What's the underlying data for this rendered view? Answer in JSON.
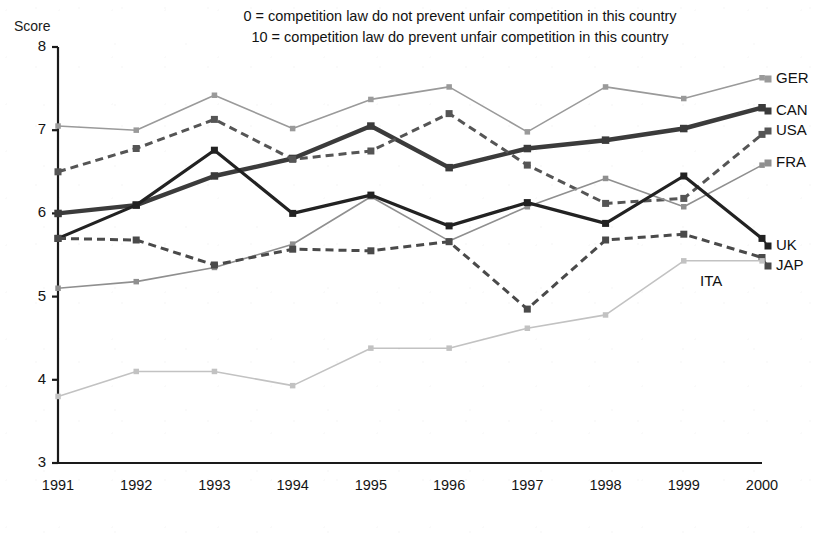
{
  "chart_data": {
    "type": "line",
    "title": "",
    "subtitle_lines": [
      "0 = competition law do not prevent unfair competition in this country",
      "10 = competition law do prevent unfair competition in this country"
    ],
    "ylabel": "Score",
    "xlabel": "",
    "ylim": [
      3,
      8
    ],
    "yticks": [
      "8",
      "7",
      "6",
      "5",
      "4",
      "3"
    ],
    "grid": false,
    "legend_position": "right-end-of-line",
    "categories": [
      "1991",
      "1992",
      "1993",
      "1994",
      "1995",
      "1996",
      "1997",
      "1998",
      "1999",
      "2000"
    ],
    "series": [
      {
        "name": "GER",
        "label": "GER",
        "color": "#9a9a9a",
        "style": "solid-thin",
        "values": [
          7.05,
          7.0,
          7.42,
          7.02,
          7.37,
          7.52,
          6.98,
          7.52,
          7.38,
          7.63
        ]
      },
      {
        "name": "CAN",
        "label": "CAN",
        "color": "#3b3b3b",
        "style": "solid-thick",
        "values": [
          6.0,
          6.1,
          6.45,
          6.66,
          7.05,
          6.55,
          6.78,
          6.88,
          7.02,
          7.27
        ]
      },
      {
        "name": "USA",
        "label": "USA",
        "color": "#555555",
        "style": "dashed",
        "values": [
          6.5,
          6.78,
          7.13,
          6.65,
          6.75,
          7.2,
          6.58,
          6.12,
          6.18,
          6.95
        ]
      },
      {
        "name": "FRA",
        "label": "FRA",
        "color": "#8f8f8f",
        "style": "solid-thin",
        "values": [
          5.1,
          5.18,
          5.35,
          5.63,
          6.2,
          5.67,
          6.08,
          6.42,
          6.08,
          6.58
        ]
      },
      {
        "name": "UK",
        "label": "UK",
        "color": "#222222",
        "style": "solid-medium",
        "values": [
          5.7,
          6.1,
          6.76,
          6.0,
          6.22,
          5.85,
          6.13,
          5.88,
          6.45,
          5.7
        ]
      },
      {
        "name": "JAP",
        "label": "JAP",
        "color": "#4a4a4a",
        "style": "dashed",
        "values": [
          5.7,
          5.68,
          5.38,
          5.57,
          5.55,
          5.66,
          4.85,
          5.68,
          5.75,
          5.47
        ]
      },
      {
        "name": "ITA",
        "label": "ITA",
        "color": "#c2c2c2",
        "style": "solid-thin",
        "values": [
          3.8,
          4.1,
          4.1,
          3.93,
          4.38,
          4.38,
          4.62,
          4.78,
          5.43,
          5.43
        ]
      }
    ]
  },
  "labels": {
    "score": "Score",
    "ita_inline": "ITA"
  }
}
